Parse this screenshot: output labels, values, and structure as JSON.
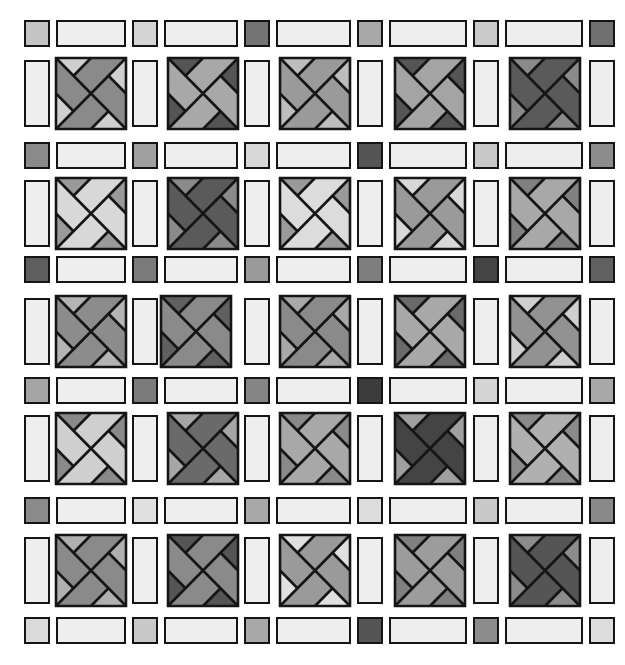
{
  "quilt": {
    "background": "#ffffff",
    "outline_color": "#151515",
    "strip_color": "#eeeeee",
    "layout": {
      "col_square_x": [
        24,
        132,
        244,
        357,
        473,
        589
      ],
      "block_x": [
        56,
        168,
        280,
        395,
        510
      ],
      "square_w": 26,
      "block_w": 70,
      "sash_row_y": [
        20,
        142,
        256,
        377,
        497,
        617
      ],
      "block_row_y": [
        58,
        178,
        296,
        413,
        535
      ],
      "sash_h": 27,
      "block_h": 71,
      "block_offsets": {
        "2-1": -7
      }
    },
    "cornerstones": [
      [
        "#c4c4c4",
        "#d4d4d4",
        "#747474",
        "#a8a8a8",
        "#cacaca",
        "#707070"
      ],
      [
        "#8a8a8a",
        "#a0a0a0",
        "#d8d8d8",
        "#555555",
        "#c8c8c8",
        "#8c8c8c"
      ],
      [
        "#5e5e5e",
        "#7a7a7a",
        "#9a9a9a",
        "#7e7e7e",
        "#444444",
        "#606060"
      ],
      [
        "#a4a4a4",
        "#7a7a7a",
        "#858585",
        "#3c3c3c",
        "#d4d4d4",
        "#a8a8a8"
      ],
      [
        "#8a8a8a",
        "#e0e0e0",
        "#a8a8a8",
        "#dcdcdc",
        "#c8c8c8",
        "#888888"
      ],
      [
        "#dadada",
        "#c8c8c8",
        "#a8a8a8",
        "#555555",
        "#8c8c8c",
        "#dcdcdc"
      ]
    ],
    "blocks": [
      [
        {
          "main": "#8a8a8a",
          "tri": "#cfcfcf"
        },
        {
          "main": "#a8a8a8",
          "tri": "#555555"
        },
        {
          "main": "#9a9a9a",
          "tri": "#bdbdbd"
        },
        {
          "main": "#a4a4a4",
          "tri": "#555555"
        },
        {
          "main": "#5a5a5a",
          "tri": "#8a8a8a"
        }
      ],
      [
        {
          "main": "#d8d8d8",
          "tri": "#9a9a9a"
        },
        {
          "main": "#5a5a5a",
          "tri": "#8a8a8a"
        },
        {
          "main": "#dcdcdc",
          "tri": "#9a9a9a"
        },
        {
          "main": "#9a9a9a",
          "tri": "#d8d8d8"
        },
        {
          "main": "#a8a8a8",
          "tri": "#808080"
        }
      ],
      [
        {
          "main": "#8c8c8c",
          "tri": "#b4b4b4"
        },
        {
          "main": "#8a8a8a",
          "tri": "#606060"
        },
        {
          "main": "#8a8a8a",
          "tri": "#a8a8a8"
        },
        {
          "main": "#a8a8a8",
          "tri": "#6a6a6a"
        },
        {
          "main": "#929292",
          "tri": "#cfcfcf"
        }
      ],
      [
        {
          "main": "#cfcfcf",
          "tri": "#8a8a8a"
        },
        {
          "main": "#6a6a6a",
          "tri": "#a6a6a6"
        },
        {
          "main": "#a8a8a8",
          "tri": "#8a8a8a"
        },
        {
          "main": "#444444",
          "tri": "#a0a0a0"
        },
        {
          "main": "#b0b0b0",
          "tri": "#8a8a8a"
        }
      ],
      [
        {
          "main": "#8a8a8a",
          "tri": "#b0b0b0"
        },
        {
          "main": "#8a8a8a",
          "tri": "#555555"
        },
        {
          "main": "#9a9a9a",
          "tri": "#e0e0e0"
        },
        {
          "main": "#9c9c9c",
          "tri": "#808080"
        },
        {
          "main": "#555555",
          "tri": "#8c8c8c"
        }
      ]
    ]
  }
}
